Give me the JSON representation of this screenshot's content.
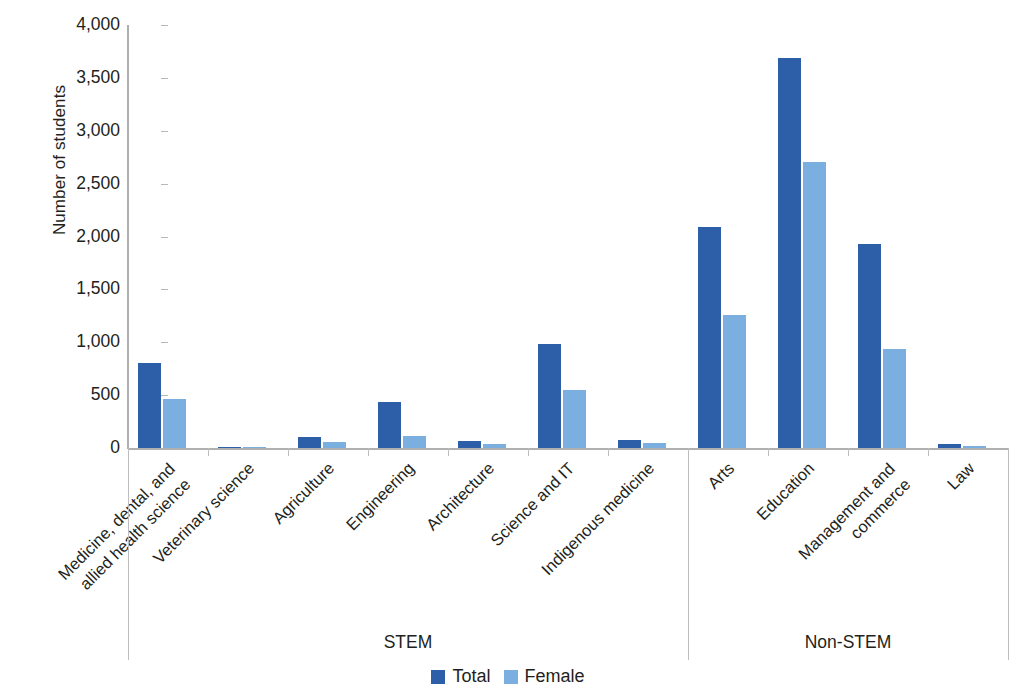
{
  "chart_data": {
    "type": "bar",
    "title": "",
    "xlabel": "",
    "ylabel": "Number of students",
    "ylim": [
      0,
      4000
    ],
    "ytick_labels": [
      "4,000",
      "3,500",
      "3,000",
      "2,500",
      "2,000",
      "1,500",
      "1,000",
      "500",
      "0"
    ],
    "ytick_values": [
      4000,
      3500,
      3000,
      2500,
      2000,
      1500,
      1000,
      500,
      0
    ],
    "grid": false,
    "legend_position": "bottom-center",
    "categories": [
      "Medicine, dental, and\nallied health science",
      "Veterinary science",
      "Agriculture",
      "Engineering",
      "Architecture",
      "Science and IT",
      "Indigenous medicine",
      "Arts",
      "Education",
      "Management and\ncommerce",
      "Law"
    ],
    "series": [
      {
        "name": "Total",
        "color": "#2c5fa8",
        "values": [
          800,
          8,
          100,
          435,
          65,
          980,
          75,
          2090,
          3690,
          1925,
          40
        ]
      },
      {
        "name": "Female",
        "color": "#7bafe0",
        "values": [
          460,
          5,
          60,
          115,
          40,
          550,
          45,
          1255,
          2705,
          940,
          15
        ]
      }
    ],
    "groups": [
      {
        "label": "STEM",
        "categories": 7
      },
      {
        "label": "Non-STEM",
        "categories": 4
      }
    ]
  },
  "legend": {
    "items": [
      {
        "label": "Total",
        "swatch": "total"
      },
      {
        "label": "Female",
        "swatch": "female"
      }
    ]
  },
  "axis": {
    "y_title": "Number of students"
  },
  "group_labels": {
    "stem": "STEM",
    "non_stem": "Non-STEM"
  }
}
